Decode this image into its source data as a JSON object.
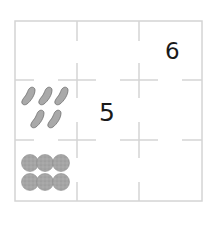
{
  "grid": {
    "rows": 3,
    "cols": 3,
    "line_color": "#d4d4d4",
    "cells": [
      [
        "",
        "",
        "6"
      ],
      [
        "beans",
        "5",
        ""
      ],
      [
        "cookies",
        "",
        ""
      ]
    ]
  },
  "numbers": {
    "top_right": "6",
    "middle_center": "5"
  },
  "pictures": {
    "beans": {
      "icon": "bean-icon",
      "count": 5,
      "color": "#a8a8a8"
    },
    "cookies": {
      "icon": "cookie-icon",
      "count": 6,
      "color": "#a3a3a3"
    }
  }
}
